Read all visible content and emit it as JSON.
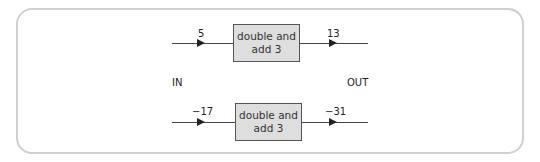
{
  "diagram": {
    "labels": {
      "in": "IN",
      "out": "OUT"
    },
    "machines": [
      {
        "input": "5",
        "rule": "double and add 3",
        "output": "13"
      },
      {
        "input": "−17",
        "rule": "double and add 3",
        "output": "−31"
      }
    ],
    "colors": {
      "box_fill": "#dedede",
      "box_border": "#555555",
      "panel_border": "#d0d0d0"
    }
  }
}
